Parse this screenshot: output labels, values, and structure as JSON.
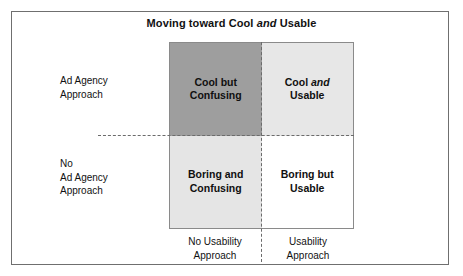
{
  "figure": {
    "title_prefix": "Moving toward Cool ",
    "title_emphasis": "and",
    "title_suffix": " Usable"
  },
  "colors": {
    "quadrant_cool_confusing": "#9e9e9e",
    "quadrant_cool_usable": "#e7e7e7",
    "quadrant_boring_confusing": "#e5e5e5",
    "quadrant_boring_usable": "#ffffff",
    "frame_border": "#6f6f6f",
    "matrix_border": "#8a8a8a",
    "axis_dash": "#6b6b6b",
    "text": "#111111"
  },
  "rows": [
    {
      "lines": [
        "Ad Agency",
        "Approach"
      ]
    },
    {
      "lines": [
        "No",
        "Ad Agency",
        "Approach"
      ]
    }
  ],
  "columns": [
    {
      "lines": [
        "No Usability",
        "Approach"
      ]
    },
    {
      "lines": [
        "Usability",
        "Approach"
      ]
    }
  ],
  "quadrants": {
    "top_left": {
      "line1": "Cool but",
      "line2": "Confusing"
    },
    "top_right": {
      "line1_prefix": "Cool ",
      "line1_emphasis": "and",
      "line2": "Usable"
    },
    "bottom_left": {
      "line1": "Boring and",
      "line2": "Confusing"
    },
    "bottom_right": {
      "line1": "Boring but",
      "line2": "Usable"
    }
  }
}
